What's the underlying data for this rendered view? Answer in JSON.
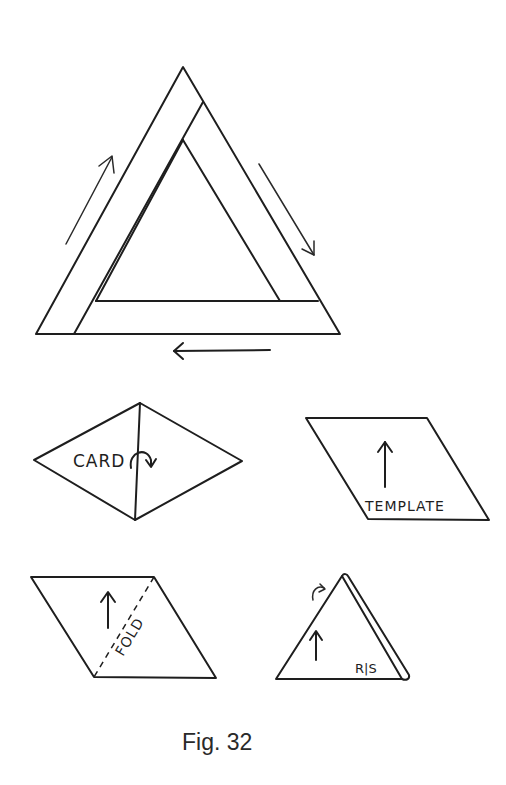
{
  "figure": {
    "caption": "Fig. 32"
  },
  "big_triangle": {
    "description": "Triangle frame made of three strips with direction arrows",
    "arrows": [
      "up-left-side",
      "down-right-side",
      "left-bottom"
    ]
  },
  "card_diamond": {
    "label": "CARD",
    "fold_arrow": "curved-arrow"
  },
  "template_parallelogram": {
    "label": "TEMPLATE",
    "arrow": "up-arrow"
  },
  "fold_parallelogram": {
    "label": "FOLD",
    "arrow": "up-arrow",
    "fold_line": "dashed-diagonal"
  },
  "folded_triangle": {
    "label": "R|S",
    "arrow": "up-arrow",
    "fold_arrow": "small-curved-arrow"
  },
  "colors": {
    "line": "#1e1e1e",
    "background": "#ffffff",
    "caption": "#2a2a2a"
  }
}
